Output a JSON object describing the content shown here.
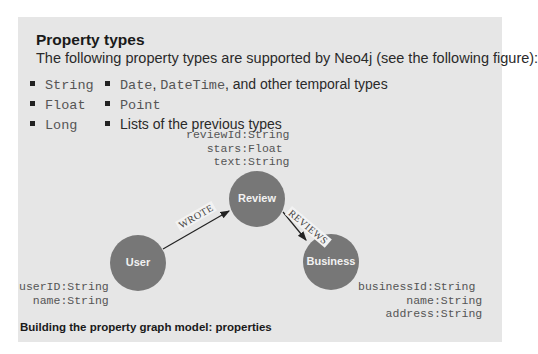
{
  "box": {
    "title": "Property types",
    "intro": "The following property types are supported by Neo4j (see the following figure):",
    "left_list": [
      "String",
      "Float",
      "Long"
    ],
    "right_list": [
      {
        "code": "Date",
        "sep": ", ",
        "code2": "DateTime",
        "text": ", and other temporal types"
      },
      {
        "code": "Point"
      },
      {
        "text": "Lists of the previous types"
      }
    ]
  },
  "figure": {
    "nodes": {
      "review": {
        "label": "Review",
        "props": "reviewId:String\n   stars:Float\n    text:String"
      },
      "user": {
        "label": "User",
        "props": "userID:String\n  name:String"
      },
      "business": {
        "label": "Business",
        "props": "businessId:String\n       name:String\n    address:String"
      }
    },
    "edges": {
      "wrote": "WROTE",
      "reviews": "REVIEWS"
    },
    "node_color": "#777777",
    "caption": "Building the property graph model: properties"
  }
}
